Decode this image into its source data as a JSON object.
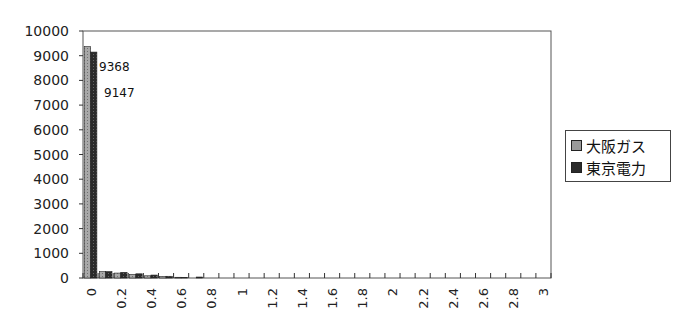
{
  "chart_data": {
    "type": "bar",
    "title": "",
    "xlabel": "",
    "ylabel": "",
    "ylim": [
      0,
      10000
    ],
    "yticks": [
      0,
      1000,
      2000,
      3000,
      4000,
      5000,
      6000,
      7000,
      8000,
      9000,
      10000
    ],
    "categories": [
      "0",
      "0.1",
      "0.2",
      "0.3",
      "0.4",
      "0.5",
      "0.6",
      "0.7",
      "0.8",
      "0.9",
      "1",
      "1.1",
      "1.2",
      "1.3",
      "1.4",
      "1.5",
      "1.6",
      "1.7",
      "1.8",
      "1.9",
      "2",
      "2.1",
      "2.2",
      "2.3",
      "2.4",
      "2.5",
      "2.6",
      "2.7",
      "2.8",
      "2.9",
      "3"
    ],
    "xtick_labels": [
      "0",
      "0.2",
      "0.4",
      "0.6",
      "0.8",
      "1",
      "1.2",
      "1.4",
      "1.6",
      "1.8",
      "2",
      "2.2",
      "2.4",
      "2.6",
      "2.8",
      "3"
    ],
    "series": [
      {
        "name": "大阪ガス",
        "color": "#9a9a9a",
        "values": [
          9368,
          260,
          200,
          150,
          90,
          60,
          30,
          0,
          0,
          0,
          0,
          0,
          0,
          0,
          0,
          0,
          0,
          0,
          0,
          0,
          0,
          0,
          0,
          0,
          0,
          0,
          0,
          0,
          0,
          0,
          0
        ]
      },
      {
        "name": "東京電力",
        "color": "#2b2b2b",
        "values": [
          9147,
          260,
          230,
          170,
          120,
          70,
          20,
          40,
          0,
          0,
          0,
          0,
          0,
          0,
          0,
          0,
          0,
          0,
          0,
          0,
          0,
          0,
          0,
          0,
          0,
          0,
          0,
          0,
          0,
          0,
          0
        ]
      }
    ],
    "annotations": [
      {
        "text": "9368",
        "series": "大阪ガス",
        "category": "0"
      },
      {
        "text": "9147",
        "series": "東京電力",
        "category": "0"
      }
    ],
    "grid": false,
    "legend_position": "right"
  },
  "legend": {
    "items": [
      {
        "label": "大阪ガス",
        "color": "#9a9a9a"
      },
      {
        "label": "東京電力",
        "color": "#2b2b2b"
      }
    ]
  }
}
